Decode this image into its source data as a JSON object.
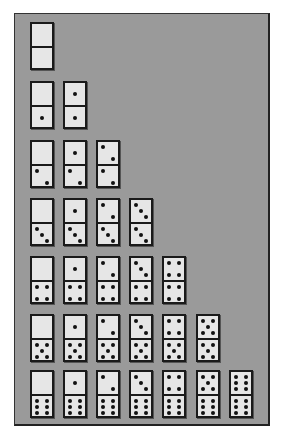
{
  "colors": {
    "panel_bg": "#9a9a9a",
    "tile_face": "#e6e6e6",
    "tile_border": "#1a1a1a",
    "pip": "#111111"
  },
  "layout": {
    "col_x": [
      30,
      63,
      96,
      129,
      162,
      196,
      229
    ],
    "row_y": [
      22,
      81,
      140,
      198,
      256,
      314,
      370
    ]
  },
  "rows": [
    {
      "bottom": 0,
      "tiles": [
        [
          0,
          0
        ]
      ]
    },
    {
      "bottom": 1,
      "tiles": [
        [
          0,
          1
        ],
        [
          1,
          1
        ]
      ]
    },
    {
      "bottom": 2,
      "tiles": [
        [
          0,
          2
        ],
        [
          1,
          2
        ],
        [
          2,
          2
        ]
      ]
    },
    {
      "bottom": 3,
      "tiles": [
        [
          0,
          3
        ],
        [
          1,
          3
        ],
        [
          2,
          3
        ],
        [
          3,
          3
        ]
      ]
    },
    {
      "bottom": 4,
      "tiles": [
        [
          0,
          4
        ],
        [
          1,
          4
        ],
        [
          2,
          4
        ],
        [
          3,
          4
        ],
        [
          4,
          4
        ]
      ]
    },
    {
      "bottom": 5,
      "tiles": [
        [
          0,
          5
        ],
        [
          1,
          5
        ],
        [
          2,
          5
        ],
        [
          3,
          5
        ],
        [
          4,
          5
        ],
        [
          5,
          5
        ]
      ]
    },
    {
      "bottom": 6,
      "tiles": [
        [
          0,
          6
        ],
        [
          1,
          6
        ],
        [
          2,
          6
        ],
        [
          3,
          6
        ],
        [
          4,
          6
        ],
        [
          5,
          6
        ],
        [
          6,
          6
        ]
      ]
    }
  ],
  "tile_count": 28
}
